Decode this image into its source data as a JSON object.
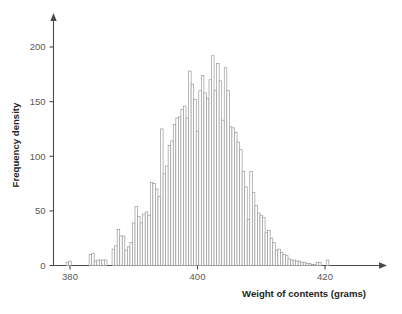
{
  "chart_data": {
    "type": "bar",
    "title": "",
    "subtitle": "",
    "xlabel": "Weight of contents (grams)",
    "ylabel": "Frequency density",
    "grid": false,
    "legend": false,
    "xlim": [
      378.0,
      423.0
    ],
    "ylim": [
      0,
      215
    ],
    "xticks": [
      380,
      400,
      420
    ],
    "xtick_labels": [
      "380",
      "400",
      "420"
    ],
    "yticks": [
      0,
      50,
      100,
      150,
      200
    ],
    "ytick_labels": [
      "0",
      "50",
      "100",
      "150",
      "200"
    ],
    "bin_width": 0.4,
    "bin_start": 378.6,
    "categories": [
      "378.6",
      "379.0",
      "379.4",
      "379.8",
      "380.2",
      "380.6",
      "381.0",
      "381.4",
      "381.8",
      "382.2",
      "382.6",
      "383.0",
      "383.4",
      "383.8",
      "384.2",
      "384.6",
      "385.0",
      "385.4",
      "385.8",
      "386.2",
      "386.6",
      "387.0",
      "387.4",
      "387.8",
      "388.2",
      "388.6",
      "389.0",
      "389.4",
      "389.8",
      "390.2",
      "390.6",
      "391.0",
      "391.4",
      "391.8",
      "392.2",
      "392.6",
      "393.0",
      "393.4",
      "393.8",
      "394.2",
      "394.6",
      "395.0",
      "395.4",
      "395.8",
      "396.2",
      "396.6",
      "397.0",
      "397.4",
      "397.8",
      "398.2",
      "398.6",
      "399.0",
      "399.4",
      "399.8",
      "400.2",
      "400.6",
      "401.0",
      "401.4",
      "401.8",
      "402.2",
      "402.6",
      "403.0",
      "403.4",
      "403.8",
      "404.2",
      "404.6",
      "405.0",
      "405.4",
      "405.8",
      "406.2",
      "406.6",
      "407.0",
      "407.4",
      "407.8",
      "408.2",
      "408.6",
      "409.0",
      "409.4",
      "409.8",
      "410.2",
      "410.6",
      "411.0",
      "411.4",
      "411.8",
      "412.2",
      "412.6",
      "413.0",
      "413.4",
      "413.8",
      "414.2",
      "414.6",
      "415.0",
      "415.4",
      "415.8",
      "416.2",
      "416.6",
      "417.0",
      "417.4",
      "417.8",
      "418.2",
      "418.6",
      "419.0",
      "419.4",
      "419.8",
      "420.2",
      "420.6",
      "421.0",
      "421.4"
    ],
    "values": [
      0,
      0,
      3,
      4,
      0,
      0,
      0,
      0,
      0,
      0,
      0,
      10,
      11,
      4,
      5,
      5,
      5,
      5,
      0,
      0,
      15,
      18,
      33,
      27,
      27,
      14,
      17,
      21,
      39,
      54,
      45,
      39,
      47,
      49,
      46,
      76,
      75,
      70,
      63,
      125,
      84,
      91,
      110,
      114,
      129,
      135,
      136,
      143,
      146,
      135,
      178,
      166,
      152,
      123,
      160,
      174,
      158,
      153,
      170,
      192,
      160,
      185,
      169,
      133,
      181,
      160,
      127,
      126,
      122,
      113,
      106,
      86,
      72,
      42,
      86,
      67,
      55,
      48,
      46,
      44,
      30,
      32,
      25,
      21,
      14,
      15,
      12,
      10,
      9,
      6,
      5,
      5,
      4,
      4,
      3,
      3,
      2,
      2,
      1,
      1,
      3,
      3,
      0,
      0,
      5,
      0,
      0,
      0
    ]
  }
}
